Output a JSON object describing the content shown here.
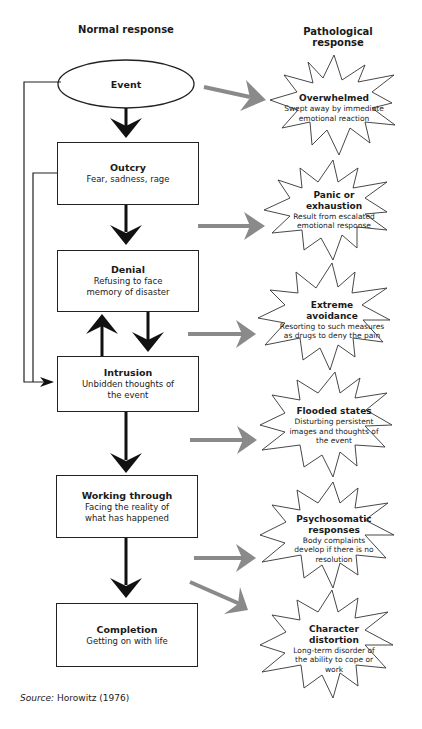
{
  "columns": {
    "normal": "Normal response",
    "pathological": "Pathological response"
  },
  "normal_stages": [
    {
      "title": "Event",
      "desc": ""
    },
    {
      "title": "Outcry",
      "desc": "Fear, sadness, rage"
    },
    {
      "title": "Denial",
      "desc": "Refusing to face memory of disaster"
    },
    {
      "title": "Intrusion",
      "desc": "Unbidden thoughts of the event"
    },
    {
      "title": "Working through",
      "desc": "Facing the reality of what has happened"
    },
    {
      "title": "Completion",
      "desc": "Getting on with life"
    }
  ],
  "pathological_stages": [
    {
      "title": "Overwhelmed",
      "desc": "Swept away by immediate emotional reaction"
    },
    {
      "title": "Panic or exhaustion",
      "desc": "Result from escalated emotional response"
    },
    {
      "title": "Extreme avoidance",
      "desc": "Resorting to such measures as drugs to deny the pain"
    },
    {
      "title": "Flooded states",
      "desc": "Disturbing persistent images and thoughts of the event"
    },
    {
      "title": "Psychosomatic responses",
      "desc": "Body complaints develop if there is no resolution"
    },
    {
      "title": "Character distortion",
      "desc": "Long-term disorder of the ability to cope or work"
    }
  ],
  "source": {
    "label": "Source:",
    "text": " Horowitz (1976)"
  },
  "colors": {
    "black_arrow": "#111111",
    "gray_arrow": "#8a8a8a",
    "outline": "#222222"
  }
}
